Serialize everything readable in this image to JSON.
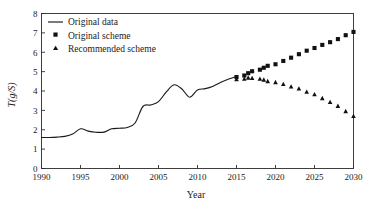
{
  "chart_data": {
    "type": "line",
    "title": "",
    "xlabel": "Year",
    "ylabel": "T(g/S)",
    "xlim": [
      1990,
      2030
    ],
    "ylim": [
      0,
      8
    ],
    "xticks": [
      1990,
      1995,
      2000,
      2005,
      2010,
      2015,
      2020,
      2025,
      2030
    ],
    "yticks": [
      0,
      1,
      2,
      3,
      4,
      5,
      6,
      7,
      8
    ],
    "grid": false,
    "legend_position": "top-left",
    "series": [
      {
        "name": "Original data",
        "marker": "line",
        "x": [
          1990,
          1991,
          1992,
          1993,
          1994,
          1995,
          1996,
          1997,
          1998,
          1999,
          2000,
          2001,
          2002,
          2003,
          2004,
          2005,
          2006,
          2007,
          2008,
          2009,
          2010,
          2011,
          2012,
          2013,
          2014,
          2015
        ],
        "values": [
          1.6,
          1.6,
          1.62,
          1.66,
          1.78,
          2.05,
          1.93,
          1.87,
          1.88,
          2.05,
          2.08,
          2.12,
          2.35,
          3.2,
          3.28,
          3.45,
          3.95,
          4.32,
          4.1,
          3.68,
          4.05,
          4.12,
          4.25,
          4.45,
          4.62,
          4.75
        ]
      },
      {
        "name": "Original scheme",
        "marker": "square",
        "x": [
          2015,
          2016,
          2016.5,
          2017,
          2018,
          2018.5,
          2019,
          2020,
          2021,
          2022,
          2023,
          2024,
          2025,
          2026,
          2027,
          2028,
          2029,
          2030
        ],
        "values": [
          4.72,
          4.8,
          4.92,
          5.02,
          5.1,
          5.2,
          5.3,
          5.38,
          5.55,
          5.72,
          5.9,
          6.08,
          6.22,
          6.38,
          6.52,
          6.68,
          6.88,
          7.05
        ]
      },
      {
        "name": "Recommended scheme",
        "marker": "triangle",
        "x": [
          2015,
          2016,
          2016.5,
          2017,
          2018,
          2018.5,
          2019,
          2020,
          2021,
          2022,
          2023,
          2024,
          2025,
          2026,
          2027,
          2028,
          2029,
          2030
        ],
        "values": [
          4.6,
          4.62,
          4.68,
          4.66,
          4.62,
          4.58,
          4.5,
          4.45,
          4.35,
          4.22,
          4.12,
          3.95,
          3.82,
          3.62,
          3.42,
          3.22,
          2.95,
          2.7
        ]
      }
    ]
  },
  "axes": {
    "x_title": "Year",
    "y_title": "T(g/S)"
  },
  "legend": {
    "items": [
      {
        "label": "Original data",
        "marker": "line"
      },
      {
        "label": "Original scheme",
        "marker": "square"
      },
      {
        "label": "Recommended scheme",
        "marker": "triangle"
      }
    ]
  },
  "colors": {
    "line": "#1a1a1a",
    "marker": "#111111",
    "axis": "#2b2b2b",
    "background": "#ffffff"
  }
}
